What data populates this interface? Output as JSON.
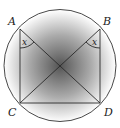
{
  "diagram": {
    "type": "geometry",
    "circle": {
      "cx": 60,
      "cy": 65.5,
      "r": 56
    },
    "points": {
      "A": {
        "label": "A",
        "x": 20,
        "y": 29
      },
      "B": {
        "label": "B",
        "x": 100,
        "y": 29
      },
      "C": {
        "label": "C",
        "x": 20,
        "y": 103
      },
      "D": {
        "label": "D",
        "x": 100,
        "y": 103
      }
    },
    "segments": [
      "AC",
      "BD",
      "CD",
      "AD",
      "BC"
    ],
    "angles": [
      {
        "vertex": "A",
        "label": "x"
      },
      {
        "vertex": "B",
        "label": "x"
      }
    ],
    "colors": {
      "stroke": "#333333",
      "shade_center": "#5a5a5a",
      "shade_edge": "#ffffff"
    }
  }
}
